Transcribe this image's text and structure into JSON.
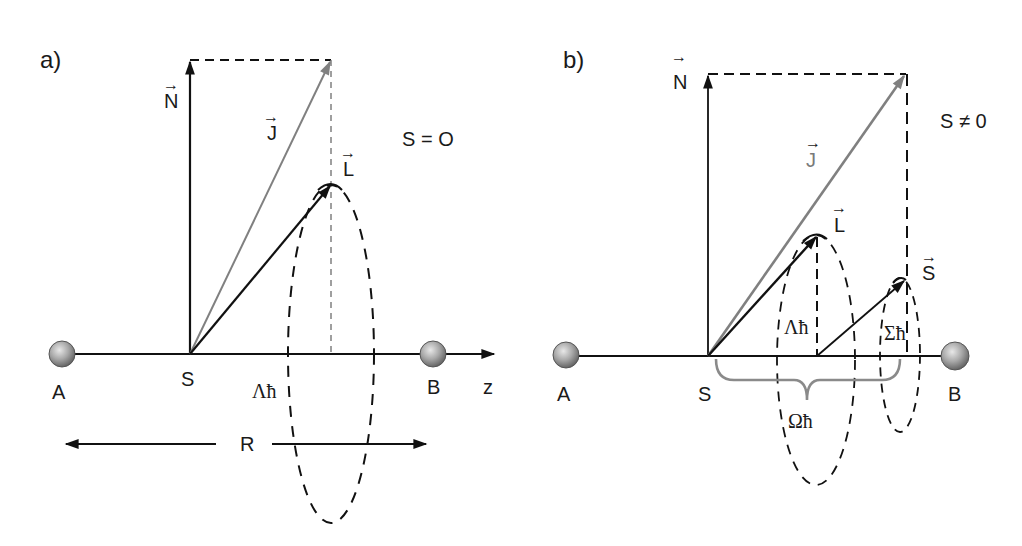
{
  "panels": [
    {
      "id": "a",
      "label": "a)",
      "condition": "S = O",
      "vectors": {
        "N": "N",
        "J": "J",
        "L": "L"
      },
      "atoms": {
        "left": "A",
        "right": "B"
      },
      "center_label": "S",
      "axis_label": "z",
      "projection_label": "Λħ",
      "distance_label": "R"
    },
    {
      "id": "b",
      "label": "b)",
      "condition": "S ≠ 0",
      "vectors": {
        "N": "N",
        "J": "J",
        "L": "L",
        "S": "S"
      },
      "atoms": {
        "left": "A",
        "right": "B"
      },
      "center_label": "S",
      "projection_labels": {
        "lambda": "Λħ",
        "sigma": "Σħ",
        "omega": "Ωħ"
      }
    }
  ],
  "colors": {
    "line": "#111111",
    "j_vector": "#808080",
    "brace": "#8a8a8a",
    "atom_light": "#e0e0e0",
    "atom_dark": "#6e6e6e"
  },
  "arrow_glyph": "→"
}
